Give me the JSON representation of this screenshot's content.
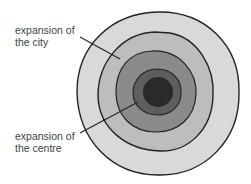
{
  "labels": {
    "city_line1": "expansion of",
    "city_line2": "the city",
    "centre_line1": "expansion of",
    "centre_line2": "the centre"
  },
  "rings": [
    {
      "name": "outer-zone",
      "fill": "#d9d9d9"
    },
    {
      "name": "city-zone",
      "fill": "#bdbdbd"
    },
    {
      "name": "middle-zone",
      "fill": "#8a8a8a"
    },
    {
      "name": "inner-zone",
      "fill": "#5e5e5e"
    },
    {
      "name": "centre-core",
      "fill": "#2a2a2a"
    }
  ]
}
